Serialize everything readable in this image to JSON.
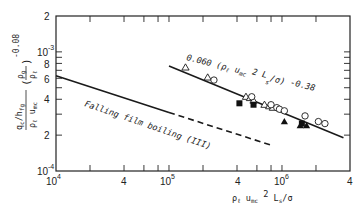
{
  "chart_data": {
    "type": "scatter",
    "title": "",
    "xlabel": "ρ_ℓ u_mc² L_s/σ",
    "ylabel": "(q_c/h_fg)/(ρ_ℓ u_mc) · (ρ_g/ρ_ℓ)^-0.08",
    "xscale": "log",
    "yscale": "log",
    "xlim": [
      10000,
      4000000
    ],
    "ylim": [
      0.0001,
      0.002
    ],
    "grid": false,
    "x_ticks": [
      {
        "value": 10000,
        "label": "10^4"
      },
      {
        "value": 40000,
        "label": "4"
      },
      {
        "value": 100000,
        "label": "10^5"
      },
      {
        "value": 400000,
        "label": "4"
      },
      {
        "value": 1000000,
        "label": "10^6"
      },
      {
        "value": 4000000,
        "label": "4"
      }
    ],
    "y_ticks": [
      {
        "value": 0.0001,
        "label": "10^-4"
      },
      {
        "value": 0.0002,
        "label": "2"
      },
      {
        "value": 0.0004,
        "label": "4"
      },
      {
        "value": 0.0006,
        "label": "6"
      },
      {
        "value": 0.0008,
        "label": "8"
      },
      {
        "value": 0.001,
        "label": "10^-3"
      },
      {
        "value": 0.002,
        "label": "2"
      }
    ],
    "annotations": [
      {
        "text": "0.060 (ρ_ℓ u_mc² L_s/σ)^-0.38",
        "x": 180000,
        "y": 0.0011
      },
      {
        "text": "Falling film boiling (III)",
        "x": 20000,
        "y": 0.00032
      }
    ],
    "series": [
      {
        "name": "Correlation 0.060 (ρ_ℓ u_mc² L_s/σ)^-0.38",
        "style": "solid-line",
        "x": [
          100000,
          3500000
        ],
        "y": [
          0.00076,
          0.00019
        ]
      },
      {
        "name": "Falling film boiling (III) solid",
        "style": "solid-line",
        "x": [
          10000,
          100000
        ],
        "y": [
          0.00063,
          0.00031
        ]
      },
      {
        "name": "Falling film boiling (III) extrapolated",
        "style": "dashed-line",
        "x": [
          100000,
          800000
        ],
        "y": [
          0.00031,
          0.000165
        ]
      },
      {
        "name": "open triangles",
        "style": "open-triangle",
        "x": [
          140000,
          220000,
          480000,
          520000,
          560000,
          700000,
          770000,
          830000
        ],
        "y": [
          0.00074,
          0.00061,
          0.00042,
          0.00041,
          0.00039,
          0.00036,
          0.00035,
          0.00034
        ]
      },
      {
        "name": "open circles",
        "style": "open-circle",
        "x": [
          250000,
          540000,
          800000,
          900000,
          950000,
          1050000,
          1600000,
          2100000,
          2400000
        ],
        "y": [
          0.00058,
          0.00042,
          0.00036,
          0.00034,
          0.00033,
          0.00032,
          0.00029,
          0.00026,
          0.00025
        ]
      },
      {
        "name": "filled squares",
        "style": "filled-square",
        "x": [
          420000,
          560000,
          1500000
        ],
        "y": [
          0.00037,
          0.00036,
          0.00025
        ]
      },
      {
        "name": "filled triangles",
        "style": "filled-triangle",
        "x": [
          1050000,
          1450000,
          1650000
        ],
        "y": [
          0.00026,
          0.00024,
          0.00024
        ]
      }
    ]
  },
  "labels": {
    "y_ticks": [
      "2",
      "10",
      "-3",
      "8",
      "6",
      "4",
      "2",
      "10",
      "-4"
    ],
    "x_ticks": [
      "10",
      "4",
      "4",
      "10",
      "5",
      "4",
      "10",
      "6",
      "4"
    ],
    "correlation": "0.060 (ρ",
    "correlation_sub": "ℓ",
    "correlation_u": " u",
    "correlation_u_sub": "mc",
    "correlation_rest": " 2 L",
    "correlation_s": "s",
    "correlation_end": "/σ) ",
    "correlation_exp": "-0.38",
    "falling": "Falling film boiling (III)",
    "xlabel_main": "ρ",
    "xlabel_l": "ℓ",
    "xlabel_u": " u",
    "xlabel_mc": "mc",
    "xlabel_sq": " 2",
    "xlabel_L": " L",
    "xlabel_s": "s",
    "xlabel_end": "/σ",
    "ylabel_num": "q",
    "ylabel_c": "c",
    "ylabel_fg": "/h",
    "ylabel_fg_sub": "fg",
    "ylabel_den": "ρ",
    "ylabel_den_l": "ℓ",
    "ylabel_den_u": " u",
    "ylabel_den_mc": "mc",
    "ylabel_paren": "(",
    "ylabel_rho_g": "ρ",
    "ylabel_g": "g",
    "ylabel_rho_l": "ρ",
    "ylabel_l": "ℓ",
    "ylabel_close": ")",
    "ylabel_exp": "-0.08"
  }
}
